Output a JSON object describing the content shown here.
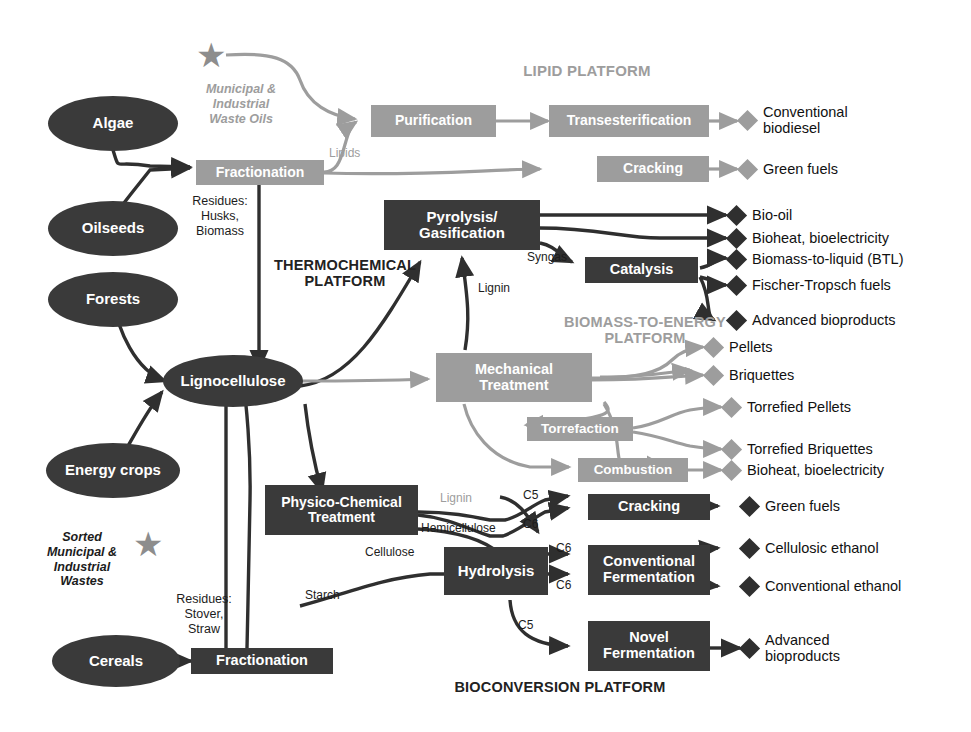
{
  "diagram": {
    "colors": {
      "dark": "#3a3a3a",
      "gray": "#9d9d9d",
      "text": "#111111"
    }
  },
  "platform_labels": [
    {
      "id": "lipid",
      "text": "LIPID PLATFORM",
      "tone": "gray"
    },
    {
      "id": "thermochemical",
      "line1": "THERMOCHEMICAL",
      "line2": "PLATFORM",
      "tone": "dark"
    },
    {
      "id": "biomass_energy",
      "line1": "BIOMASS-TO-ENERGY",
      "line2": "PLATFORM",
      "tone": "gray"
    },
    {
      "id": "bioconversion",
      "text": "BIOCONVERSION PLATFORM",
      "tone": "dark"
    }
  ],
  "feedstocks": [
    {
      "id": "algae",
      "label": "Algae"
    },
    {
      "id": "oilseeds",
      "label": "Oilseeds"
    },
    {
      "id": "forests",
      "label": "Forests"
    },
    {
      "id": "energy-crops",
      "label": "Energy crops"
    },
    {
      "id": "cereals",
      "label": "Cereals"
    }
  ],
  "intermediate_nodes": [
    {
      "id": "lignocellulose",
      "label": "Lignocellulose"
    }
  ],
  "star_notes": [
    {
      "id": "waste-oils",
      "line1": "Municipal &",
      "line2": "Industrial",
      "line3": "Waste Oils"
    },
    {
      "id": "sorted-wastes",
      "line1": "Sorted",
      "line2": "Municipal &",
      "line3": "Industrial",
      "line4": "Wastes"
    }
  ],
  "processes": [
    {
      "id": "fractionation-top",
      "label": "Fractionation",
      "tone": "gray"
    },
    {
      "id": "purification",
      "label": "Purification",
      "tone": "gray"
    },
    {
      "id": "transesterification",
      "label": "Transesterification",
      "tone": "gray"
    },
    {
      "id": "cracking-lipid",
      "label": "Cracking",
      "tone": "gray"
    },
    {
      "id": "pyrolysis-gasification",
      "line1": "Pyrolysis/",
      "line2": "Gasification",
      "tone": "dark"
    },
    {
      "id": "catalysis",
      "label": "Catalysis",
      "tone": "dark"
    },
    {
      "id": "mechanical-treatment",
      "line1": "Mechanical",
      "line2": "Treatment",
      "tone": "gray"
    },
    {
      "id": "torrefaction",
      "label": "Torrefaction",
      "tone": "gray"
    },
    {
      "id": "combustion",
      "label": "Combustion",
      "tone": "gray"
    },
    {
      "id": "physico-chemical-treatment",
      "line1": "Physico-Chemical",
      "line2": "Treatment",
      "tone": "dark"
    },
    {
      "id": "hydrolysis",
      "label": "Hydrolysis",
      "tone": "dark"
    },
    {
      "id": "cracking-bio",
      "label": "Cracking",
      "tone": "dark"
    },
    {
      "id": "conventional-fermentation",
      "line1": "Conventional",
      "line2": "Fermentation",
      "tone": "dark"
    },
    {
      "id": "novel-fermentation",
      "line1": "Novel",
      "line2": "Fermentation",
      "tone": "dark"
    },
    {
      "id": "fractionation-bottom",
      "label": "Fractionation",
      "tone": "dark"
    }
  ],
  "products": [
    {
      "id": "conventional-biodiesel",
      "line1": "Conventional",
      "line2": "biodiesel",
      "tone": "gray"
    },
    {
      "id": "green-fuels-lipid",
      "line1": "Green fuels",
      "tone": "gray"
    },
    {
      "id": "bio-oil",
      "line1": "Bio-oil",
      "tone": "dark"
    },
    {
      "id": "bioheat-bioelectricity-thermo",
      "line1": "Bioheat, bioelectricity",
      "tone": "dark"
    },
    {
      "id": "biomass-to-liquid",
      "line1": "Biomass-to-liquid (BTL)",
      "tone": "dark"
    },
    {
      "id": "fischer-tropsch-fuels",
      "line1": "Fischer-Tropsch fuels",
      "tone": "dark"
    },
    {
      "id": "advanced-bioproducts-thermo",
      "line1": "Advanced bioproducts",
      "tone": "dark"
    },
    {
      "id": "pellets",
      "line1": "Pellets",
      "tone": "gray"
    },
    {
      "id": "briquettes",
      "line1": "Briquettes",
      "tone": "gray"
    },
    {
      "id": "torrefied-pellets",
      "line1": "Torrefied Pellets",
      "tone": "gray"
    },
    {
      "id": "torrefied-briquettes",
      "line1": "Torrefied Briquettes",
      "tone": "gray"
    },
    {
      "id": "bioheat-bioelectricity-combustion",
      "line1": "Bioheat, bioelectricity",
      "tone": "gray"
    },
    {
      "id": "green-fuels-bio",
      "line1": "Green fuels",
      "tone": "dark"
    },
    {
      "id": "cellulosic-ethanol",
      "line1": "Cellulosic ethanol",
      "tone": "dark"
    },
    {
      "id": "conventional-ethanol",
      "line1": "Conventional ethanol",
      "tone": "dark"
    },
    {
      "id": "advanced-bioproducts-bio",
      "line1": "Advanced",
      "line2": "bioproducts",
      "tone": "dark"
    }
  ],
  "flow_labels": [
    {
      "id": "lipids",
      "text": "Lipids",
      "tone": "gray"
    },
    {
      "id": "residues-husks-biomass",
      "line1": "Residues:",
      "line2": "Husks,",
      "line3": "Biomass",
      "tone": "dark"
    },
    {
      "id": "syngas",
      "text": "Syngas",
      "tone": "dark"
    },
    {
      "id": "lignin-thermo",
      "text": "Lignin",
      "tone": "dark"
    },
    {
      "id": "lignin-hydro",
      "text": "Lignin",
      "tone": "gray"
    },
    {
      "id": "hemicellulose",
      "text": "Hemicellulose",
      "tone": "dark"
    },
    {
      "id": "cellulose",
      "text": "Cellulose",
      "tone": "dark"
    },
    {
      "id": "starch",
      "text": "Starch",
      "tone": "dark"
    },
    {
      "id": "residues-stover-straw",
      "line1": "Residues:",
      "line2": "Stover,",
      "line3": "Straw",
      "tone": "dark"
    },
    {
      "id": "c5-cracking",
      "text": "C5",
      "tone": "dark"
    },
    {
      "id": "c6-cracking",
      "text": "C6",
      "tone": "dark"
    },
    {
      "id": "c6-ferm-1",
      "text": "C6",
      "tone": "dark"
    },
    {
      "id": "c6-ferm-2",
      "text": "C6",
      "tone": "dark"
    },
    {
      "id": "c5-novel",
      "text": "C5",
      "tone": "dark"
    }
  ]
}
